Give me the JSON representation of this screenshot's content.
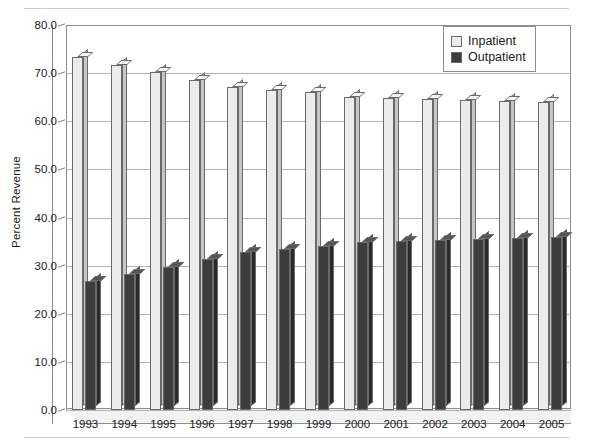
{
  "chart_data": {
    "type": "bar",
    "title": "",
    "xlabel": "",
    "ylabel": "Percent Revenue",
    "ylim": [
      0.0,
      80.0
    ],
    "ytick_step": 10.0,
    "ytick_labels": [
      "80.0",
      "70.0",
      "60.0",
      "50.0",
      "40.0",
      "30.0",
      "20.0",
      "10.0",
      "0.0"
    ],
    "ytick_values": [
      80.0,
      70.0,
      60.0,
      50.0,
      40.0,
      30.0,
      20.0,
      10.0,
      0.0
    ],
    "grid": true,
    "grid_axis": "y",
    "legend_position": "top-right",
    "style": "3d-column",
    "categories": [
      "1993",
      "1994",
      "1995",
      "1996",
      "1997",
      "1998",
      "1999",
      "2000",
      "2001",
      "2002",
      "2003",
      "2004",
      "2005"
    ],
    "series": [
      {
        "name": "Inpatient",
        "color": "#ebebeb",
        "values": [
          73.3,
          71.7,
          70.3,
          68.6,
          67.2,
          66.5,
          66.0,
          65.0,
          64.9,
          64.6,
          64.5,
          64.3,
          64.1
        ]
      },
      {
        "name": "Outpatient",
        "color": "#3d3d3d",
        "values": [
          26.8,
          28.3,
          29.7,
          31.4,
          32.8,
          33.5,
          34.0,
          35.0,
          35.1,
          35.4,
          35.5,
          35.7,
          35.9
        ]
      }
    ]
  },
  "legend": {
    "items": [
      {
        "label": "Inpatient",
        "swatch": "inpatient"
      },
      {
        "label": "Outpatient",
        "swatch": "outpatient"
      }
    ]
  }
}
